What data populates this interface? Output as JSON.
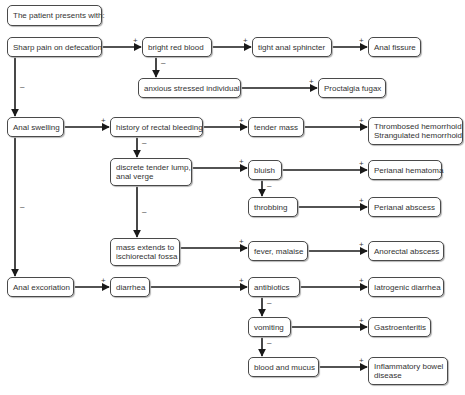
{
  "diagram": {
    "type": "flowchart",
    "title": "The patient presents with:",
    "nodes": [
      {
        "id": "start",
        "label": "The patient presents with:",
        "x": 7,
        "y": 5,
        "w": 95,
        "h": 21
      },
      {
        "id": "sharp_pain",
        "label": "Sharp pain on defecation",
        "x": 7,
        "y": 37,
        "w": 95,
        "h": 20
      },
      {
        "id": "bright_red",
        "label": "bright red blood",
        "x": 142,
        "y": 37,
        "w": 70,
        "h": 20
      },
      {
        "id": "tight_sphincter",
        "label": "tight anal sphincter",
        "x": 252,
        "y": 37,
        "w": 80,
        "h": 20
      },
      {
        "id": "anal_fissure",
        "label": "Anal fissure",
        "x": 368,
        "y": 37,
        "w": 53,
        "h": 20
      },
      {
        "id": "anxious",
        "label": "anxious stressed individual",
        "x": 138,
        "y": 78,
        "w": 103,
        "h": 20
      },
      {
        "id": "proctalgia",
        "label": "Proctalgia fugax",
        "x": 318,
        "y": 78,
        "w": 68,
        "h": 20
      },
      {
        "id": "anal_swelling",
        "label": "Anal swelling",
        "x": 7,
        "y": 117,
        "w": 57,
        "h": 20
      },
      {
        "id": "history_bleeding",
        "label": "history of rectal bleeding",
        "x": 110,
        "y": 117,
        "w": 93,
        "h": 20
      },
      {
        "id": "tender_mass",
        "label": "tender mass",
        "x": 248,
        "y": 117,
        "w": 56,
        "h": 20
      },
      {
        "id": "hemorrhoid",
        "label": "Thrombosed hemorrhoid\nStrangulated hemorrhoid",
        "x": 368,
        "y": 117,
        "w": 95,
        "h": 28
      },
      {
        "id": "discrete_lump",
        "label": "discrete tender lump,\nanal verge",
        "x": 110,
        "y": 158,
        "w": 82,
        "h": 28
      },
      {
        "id": "bluish",
        "label": "bluish",
        "x": 248,
        "y": 160,
        "w": 34,
        "h": 20
      },
      {
        "id": "perianal_hematoma",
        "label": "Perianal hematoma",
        "x": 368,
        "y": 160,
        "w": 74,
        "h": 20
      },
      {
        "id": "throbbing",
        "label": "throbbing",
        "x": 248,
        "y": 197,
        "w": 50,
        "h": 20
      },
      {
        "id": "perianal_abscess",
        "label": "Perianal abscess",
        "x": 368,
        "y": 197,
        "w": 73,
        "h": 20
      },
      {
        "id": "mass_extends",
        "label": "mass extends to\nischiorectal fossa",
        "x": 110,
        "y": 238,
        "w": 70,
        "h": 28
      },
      {
        "id": "fever",
        "label": "fever, malaise",
        "x": 248,
        "y": 241,
        "w": 60,
        "h": 20
      },
      {
        "id": "anorectal_abscess",
        "label": "Anorectal abscess",
        "x": 368,
        "y": 241,
        "w": 76,
        "h": 20
      },
      {
        "id": "anal_excoriation",
        "label": "Anal excoriation",
        "x": 7,
        "y": 277,
        "w": 67,
        "h": 20
      },
      {
        "id": "diarrhea",
        "label": "diarrhea",
        "x": 110,
        "y": 277,
        "w": 40,
        "h": 20
      },
      {
        "id": "antibiotics",
        "label": "antibiotics",
        "x": 248,
        "y": 277,
        "w": 52,
        "h": 20
      },
      {
        "id": "iatrogenic",
        "label": "Iatrogenic diarrhea",
        "x": 368,
        "y": 277,
        "w": 76,
        "h": 20
      },
      {
        "id": "vomiting",
        "label": "vomiting",
        "x": 248,
        "y": 317,
        "w": 43,
        "h": 20
      },
      {
        "id": "gastroenteritis",
        "label": "Gastroenteritis",
        "x": 368,
        "y": 317,
        "w": 63,
        "h": 20
      },
      {
        "id": "blood_mucus",
        "label": "blood and mucus",
        "x": 248,
        "y": 357,
        "w": 71,
        "h": 20
      },
      {
        "id": "ibd",
        "label": "Inflammatory bowel\ndisease",
        "x": 368,
        "y": 357,
        "w": 80,
        "h": 28
      }
    ],
    "edges": [
      {
        "from": "sharp_pain",
        "to": "bright_red",
        "sign": "+"
      },
      {
        "from": "bright_red",
        "to": "tight_sphincter",
        "sign": "+"
      },
      {
        "from": "tight_sphincter",
        "to": "anal_fissure",
        "sign": "+"
      },
      {
        "from": "bright_red",
        "to": "anxious",
        "sign": "–"
      },
      {
        "from": "anxious",
        "to": "proctalgia",
        "sign": "+"
      },
      {
        "from": "sharp_pain",
        "to": "anal_swelling",
        "sign": "–"
      },
      {
        "from": "anal_swelling",
        "to": "history_bleeding",
        "sign": "+"
      },
      {
        "from": "history_bleeding",
        "to": "tender_mass",
        "sign": "+"
      },
      {
        "from": "tender_mass",
        "to": "hemorrhoid",
        "sign": "+"
      },
      {
        "from": "history_bleeding",
        "to": "discrete_lump",
        "sign": "–"
      },
      {
        "from": "discrete_lump",
        "to": "bluish",
        "sign": "+"
      },
      {
        "from": "bluish",
        "to": "perianal_hematoma",
        "sign": "+"
      },
      {
        "from": "bluish",
        "to": "throbbing",
        "sign": "–"
      },
      {
        "from": "throbbing",
        "to": "perianal_abscess",
        "sign": "+"
      },
      {
        "from": "discrete_lump",
        "to": "mass_extends",
        "sign": "–"
      },
      {
        "from": "mass_extends",
        "to": "fever",
        "sign": "+"
      },
      {
        "from": "fever",
        "to": "anorectal_abscess",
        "sign": "+"
      },
      {
        "from": "anal_swelling",
        "to": "anal_excoriation",
        "sign": "–"
      },
      {
        "from": "anal_excoriation",
        "to": "diarrhea",
        "sign": "+"
      },
      {
        "from": "diarrhea",
        "to": "antibiotics",
        "sign": "+"
      },
      {
        "from": "antibiotics",
        "to": "iatrogenic",
        "sign": "+"
      },
      {
        "from": "antibiotics",
        "to": "vomiting",
        "sign": "–"
      },
      {
        "from": "vomiting",
        "to": "gastroenteritis",
        "sign": "+"
      },
      {
        "from": "vomiting",
        "to": "blood_mucus",
        "sign": "–"
      },
      {
        "from": "blood_mucus",
        "to": "ibd",
        "sign": "+"
      }
    ],
    "colors": {
      "line": "#1a1a1a",
      "border": "#4a4a4a",
      "text": "#333333",
      "shadow": "#b5b5b5"
    }
  }
}
